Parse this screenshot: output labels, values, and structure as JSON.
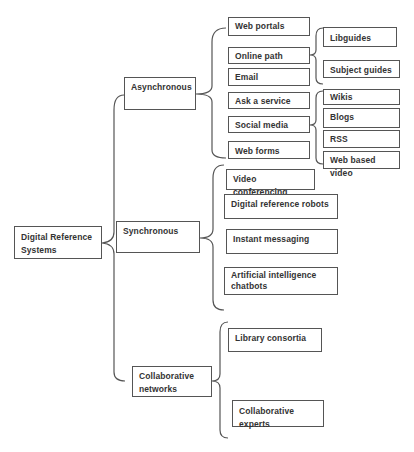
{
  "diagram": {
    "root": {
      "label": "Digital Reference Systems",
      "line1": "Digital Reference",
      "line2": "Systems"
    },
    "branches": [
      {
        "label": "Asynchronous",
        "children": [
          {
            "label": "Web portals"
          },
          {
            "label": "Online path",
            "children": [
              {
                "label": "Libguides"
              },
              {
                "label": "Subject guides"
              }
            ]
          },
          {
            "label": "Email"
          },
          {
            "label": "Ask a service"
          },
          {
            "label": "Social media",
            "children": [
              {
                "label": "Wikis"
              },
              {
                "label": "Blogs"
              },
              {
                "label": "RSS"
              },
              {
                "label": "Web based video"
              }
            ]
          },
          {
            "label": "Web forms"
          }
        ]
      },
      {
        "label": "Synchronous",
        "children": [
          {
            "label": "Video conferencing"
          },
          {
            "label": "Digital reference robots"
          },
          {
            "label": "Instant messaging"
          },
          {
            "label": "Artificial intelligence chatbots",
            "line1": "Artificial intelligence",
            "line2": "chatbots"
          }
        ]
      },
      {
        "label": "Collaborative networks",
        "line1": "Collaborative",
        "line2": "networks",
        "children": [
          {
            "label": "Library consortia"
          },
          {
            "label": "Collaborative experts"
          }
        ]
      }
    ]
  },
  "colors": {
    "line": "#555555",
    "text": "#333333",
    "background": "#ffffff"
  }
}
